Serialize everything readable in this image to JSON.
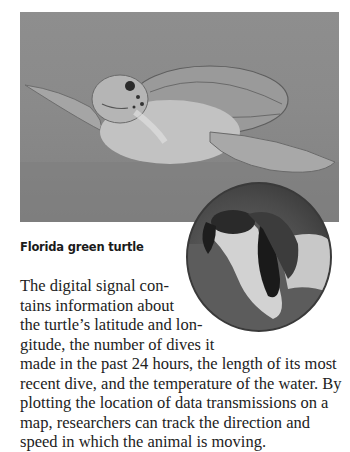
{
  "figure": {
    "main_photo": {
      "subject": "green sea turtle swimming underwater",
      "tone": "grayscale"
    },
    "inset_photo": {
      "subject": "hands holding a hatchling turtle",
      "shape": "circle"
    },
    "caption": "Florida green turtle"
  },
  "body": {
    "lines": [
      "The digital signal con-",
      "tains information about",
      "the turtle’s latitude and lon-",
      "gitude, the number of dives it",
      "made in the past 24 hours, the length of its most",
      "recent dive, and the temperature of the water. By",
      "plotting the location of data transmissions on a",
      "map, researchers can track the direction and",
      "speed in which the animal is moving."
    ]
  }
}
